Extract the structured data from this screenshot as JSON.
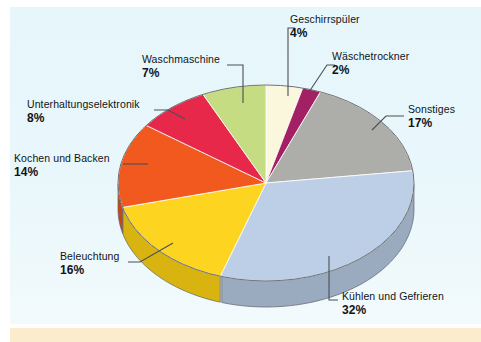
{
  "figure": {
    "background_color": "#e9f7fb",
    "bottom_strip_color": "#fbeccd",
    "label_text_color": "#111417",
    "leader_line_color": "#4a4f55"
  },
  "chart_data": {
    "type": "pie",
    "title": "",
    "subtitle": "",
    "xlabel": "",
    "ylabel": "",
    "unit": "%",
    "total": 100,
    "legend_position": "none",
    "labels_style": "outside-with-leader-lines",
    "three_d": true,
    "start_angle_deg": -90,
    "direction": "clockwise",
    "categories": [
      "Geschirrspüler",
      "Wäschetrockner",
      "Sonstiges",
      "Kühlen und Gefrieren",
      "Beleuchtung",
      "Kochen und Backen",
      "Unterhaltungselektronik",
      "Waschmaschine"
    ],
    "values": [
      4,
      2,
      17,
      32,
      16,
      14,
      8,
      7
    ],
    "value_labels": [
      "4%",
      "2%",
      "17%",
      "32%",
      "16%",
      "14%",
      "8%",
      "7%"
    ],
    "colors": [
      "#fbf7dd",
      "#a22063",
      "#adadaa",
      "#bdcfe6",
      "#fdd520",
      "#f2591f",
      "#e8284b",
      "#c6dc82"
    ],
    "side_colors": [
      "#ddd9bd",
      "#6d1342",
      "#8e8e8b",
      "#9aabc0",
      "#d9b411",
      "#c94614",
      "#c01b3b",
      "#a5ba6a"
    ],
    "slices": [
      {
        "label": "Geschirrspüler",
        "value": 4,
        "value_label": "4%",
        "color": "#fbf7dd",
        "side_color": "#ddd9bd"
      },
      {
        "label": "Wäschetrockner",
        "value": 2,
        "value_label": "2%",
        "color": "#a22063",
        "side_color": "#6d1342"
      },
      {
        "label": "Sonstiges",
        "value": 17,
        "value_label": "17%",
        "color": "#adadaa",
        "side_color": "#8e8e8b"
      },
      {
        "label": "Kühlen und Gefrieren",
        "value": 32,
        "value_label": "32%",
        "color": "#bdcfe6",
        "side_color": "#9aabc0"
      },
      {
        "label": "Beleuchtung",
        "value": 16,
        "value_label": "16%",
        "color": "#fdd520",
        "side_color": "#d9b411"
      },
      {
        "label": "Kochen und Backen",
        "value": 14,
        "value_label": "14%",
        "color": "#f2591f",
        "side_color": "#c94614"
      },
      {
        "label": "Unterhaltungselektronik",
        "value": 8,
        "value_label": "8%",
        "color": "#e8284b",
        "side_color": "#c01b3b"
      },
      {
        "label": "Waschmaschine",
        "value": 7,
        "value_label": "7%",
        "color": "#c6dc82",
        "side_color": "#a5ba6a"
      }
    ]
  },
  "labels": {
    "geschirrspueler": {
      "name": "Geschirrspüler",
      "percent": "4%"
    },
    "waeschetrockner": {
      "name": "Wäschetrockner",
      "percent": "2%"
    },
    "sonstiges": {
      "name": "Sonstiges",
      "percent": "17%"
    },
    "kuehlen": {
      "name": "Kühlen und Gefrieren",
      "percent": "32%"
    },
    "beleuchtung": {
      "name": "Beleuchtung",
      "percent": "16%"
    },
    "kochen": {
      "name": "Kochen und Backen",
      "percent": "14%"
    },
    "unterhaltung": {
      "name": "Unterhaltungselektronik",
      "percent": "8%"
    },
    "waschmaschine": {
      "name": "Waschmaschine",
      "percent": "7%"
    }
  }
}
